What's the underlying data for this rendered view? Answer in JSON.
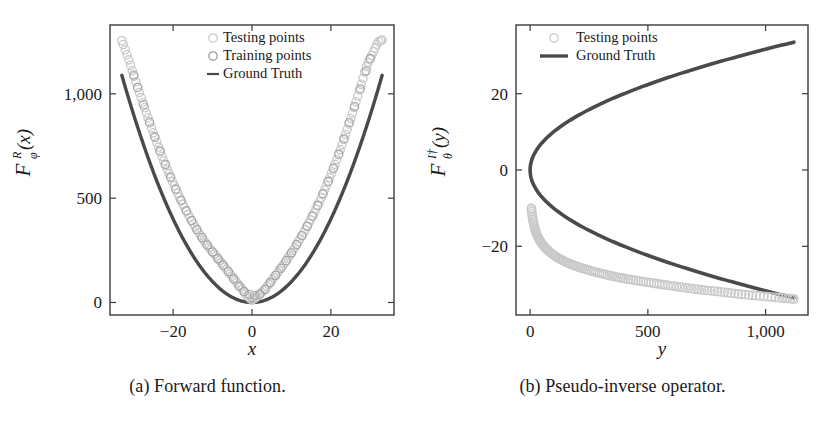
{
  "figure": {
    "panels": [
      {
        "id": "panel-a",
        "caption": "(a) Forward function.",
        "axis": {
          "xlabel": "x",
          "ylabel_main": "F",
          "ylabel_sub": "φ",
          "ylabel_sup": "R",
          "ylabel_arg": "(x)",
          "xticks": [
            "−20",
            "0",
            "20"
          ],
          "xtick_values": [
            -20,
            0,
            20
          ],
          "yticks": [
            "0",
            "500",
            "1,000"
          ],
          "ytick_values": [
            0,
            500,
            1000
          ],
          "xlim": [
            -36,
            36
          ],
          "ylim": [
            -60,
            1330
          ],
          "grid": false
        },
        "legend": {
          "position": "top-center",
          "entries": [
            {
              "label": "Testing points",
              "marker": "open-circle",
              "color": "#c9c9c9"
            },
            {
              "label": "Training points",
              "marker": "open-circle",
              "color": "#9a9a9a"
            },
            {
              "label": "Ground Truth",
              "marker": "line",
              "color": "#4a4a4a"
            }
          ]
        }
      },
      {
        "id": "panel-b",
        "caption": "(b) Pseudo-inverse operator.",
        "axis": {
          "xlabel": "y",
          "ylabel_main": "F",
          "ylabel_sub": "θ",
          "ylabel_sup": "I†",
          "ylabel_arg": "(y)",
          "xticks": [
            "0",
            "500",
            "1,000"
          ],
          "xtick_values": [
            0,
            500,
            1000
          ],
          "yticks": [
            "−20",
            "0",
            "20"
          ],
          "ytick_values": [
            -20,
            0,
            20
          ],
          "xlim": [
            -60,
            1180
          ],
          "ylim": [
            -38,
            38
          ],
          "grid": false
        },
        "legend": {
          "position": "top-center",
          "entries": [
            {
              "label": "Testing points",
              "marker": "open-circle",
              "color": "#c9c9c9"
            },
            {
              "label": "Ground Truth",
              "marker": "thick-line",
              "color": "#4a4a4a"
            }
          ]
        }
      }
    ]
  },
  "chart_data": [
    {
      "type": "scatter",
      "title": "(a) Forward function.",
      "xlabel": "x",
      "ylabel": "F_phi^R(x)",
      "xlim": [
        -36,
        36
      ],
      "ylim": [
        -60,
        1330
      ],
      "xticks": [
        -20,
        0,
        20
      ],
      "yticks": [
        0,
        500,
        1000
      ],
      "grid": false,
      "legend_position": "top-center",
      "series": [
        {
          "name": "Ground Truth",
          "type": "line",
          "color": "#4a4a4a",
          "comment": "y = x^2, smooth parabola through the frame",
          "x": [
            -33,
            -30,
            -27,
            -24,
            -21,
            -18,
            -15,
            -12,
            -9,
            -6,
            -3,
            0,
            3,
            6,
            9,
            12,
            15,
            18,
            21,
            24,
            27,
            30,
            33
          ],
          "y": [
            1089,
            900,
            729,
            576,
            441,
            324,
            225,
            144,
            81,
            36,
            9,
            0,
            9,
            36,
            81,
            144,
            225,
            324,
            441,
            576,
            729,
            900,
            1089
          ]
        },
        {
          "name": "Testing points",
          "type": "scatter",
          "color": "#c9c9c9",
          "comment": "predicted forward values, dense chain; below truth on left, below-right on right",
          "x": [
            -33,
            -32,
            -31,
            -30,
            -29,
            -28,
            -27,
            -26,
            -25,
            -24,
            -23,
            -22,
            -21,
            -20,
            -19,
            -18,
            -17,
            -16,
            -15,
            -14,
            -13,
            -12,
            -11,
            -10,
            -9,
            -8,
            -7,
            -6,
            -5,
            -4,
            -3,
            -2,
            -1,
            0,
            1,
            2,
            3,
            4,
            5,
            6,
            7,
            8,
            9,
            10,
            11,
            12,
            13,
            14,
            15,
            16,
            17,
            18,
            19,
            20,
            21,
            22,
            23,
            24,
            25,
            26,
            27,
            28,
            29,
            30,
            31,
            32,
            33
          ],
          "y": [
            1255,
            1205,
            1150,
            1090,
            1030,
            975,
            920,
            865,
            812,
            760,
            710,
            662,
            616,
            572,
            530,
            490,
            452,
            416,
            382,
            350,
            320,
            292,
            266,
            242,
            220,
            196,
            172,
            148,
            124,
            100,
            76,
            52,
            28,
            14,
            24,
            40,
            60,
            82,
            106,
            130,
            156,
            182,
            210,
            238,
            268,
            300,
            332,
            366,
            402,
            440,
            480,
            522,
            566,
            612,
            660,
            712,
            766,
            822,
            880,
            940,
            1002,
            1066,
            1130,
            1170,
            1210,
            1248,
            1258
          ]
        },
        {
          "name": "Training points",
          "type": "scatter",
          "color": "#9a9a9a",
          "comment": "overlapping the testing chain near the centre of the domain",
          "x": [
            -30,
            -26,
            -22,
            -18,
            -14,
            -10,
            -6,
            -2,
            2,
            6,
            10,
            14,
            18,
            22,
            26,
            30
          ],
          "y": [
            1090,
            865,
            662,
            490,
            350,
            242,
            148,
            52,
            40,
            130,
            238,
            366,
            522,
            712,
            940,
            1170
          ]
        }
      ]
    },
    {
      "type": "scatter",
      "title": "(b) Pseudo-inverse operator.",
      "xlabel": "y",
      "ylabel": "F_theta^{I+}(y)",
      "xlim": [
        -60,
        1180
      ],
      "ylim": [
        -38,
        38
      ],
      "xticks": [
        0,
        500,
        1000
      ],
      "yticks": [
        -20,
        0,
        20
      ],
      "grid": false,
      "legend_position": "top-center",
      "series": [
        {
          "name": "Ground Truth",
          "type": "line",
          "color": "#4a4a4a",
          "comment": "sideways parabola x = +/- sqrt(y), both branches from origin",
          "x": [
            0,
            10,
            30,
            60,
            100,
            160,
            240,
            340,
            450,
            580,
            720,
            880,
            1040,
            1120
          ],
          "y_upper": [
            0,
            3.2,
            5.5,
            7.7,
            10.0,
            12.6,
            15.5,
            18.4,
            21.2,
            24.1,
            26.8,
            29.7,
            32.2,
            33.5
          ],
          "y_lower": [
            0,
            -3.2,
            -5.5,
            -7.7,
            -10.0,
            -12.6,
            -15.5,
            -18.4,
            -21.2,
            -24.1,
            -26.8,
            -29.7,
            -32.2,
            -33.5
          ]
        },
        {
          "name": "Testing points",
          "type": "scatter",
          "color": "#c9c9c9",
          "comment": "predictions track only the lower branch, offset below it, converging at large y",
          "x": [
            5,
            12,
            22,
            36,
            54,
            76,
            102,
            132,
            166,
            204,
            246,
            292,
            342,
            396,
            454,
            516,
            582,
            652,
            726,
            804,
            886,
            972,
            1062,
            1120
          ],
          "y": [
            -10.0,
            -13.2,
            -15.8,
            -17.9,
            -19.6,
            -21.1,
            -22.4,
            -23.5,
            -24.5,
            -25.4,
            -26.2,
            -27.0,
            -27.7,
            -28.4,
            -29.0,
            -29.6,
            -30.2,
            -30.8,
            -31.4,
            -31.9,
            -32.5,
            -33.0,
            -33.5,
            -33.8
          ]
        }
      ]
    }
  ]
}
